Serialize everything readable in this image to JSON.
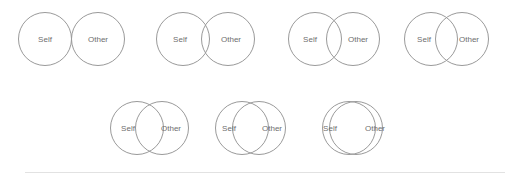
{
  "scale": {
    "name": "Inclusion of Other in the Self Scale",
    "label_self": "Self",
    "label_other": "Other",
    "stroke_color": "#9a9a9a",
    "label_color": "#6e6e6e",
    "background_color": "#ffffff",
    "divider_color": "#e2e2e2",
    "circle_radius": 26.5,
    "items": [
      {
        "index": 1,
        "overlap": 0,
        "left": 18,
        "top": 11,
        "self_x": 27,
        "other_x": 80,
        "cy": 28,
        "self_label_x": 27,
        "other_label_x": 80
      },
      {
        "index": 2,
        "overlap": 8,
        "left": 156,
        "top": 11,
        "self_x": 27,
        "other_x": 72,
        "cy": 28,
        "self_label_x": 24,
        "other_label_x": 75
      },
      {
        "index": 3,
        "overlap": 15,
        "left": 288,
        "top": 11,
        "self_x": 27,
        "other_x": 65,
        "cy": 28,
        "self_label_x": 22,
        "other_label_x": 70
      },
      {
        "index": 4,
        "overlap": 22,
        "left": 404,
        "top": 11,
        "self_x": 27,
        "other_x": 58,
        "cy": 28,
        "self_label_x": 20,
        "other_label_x": 65
      },
      {
        "index": 5,
        "overlap": 28,
        "left": 110,
        "top": 100,
        "self_x": 27,
        "other_x": 52,
        "cy": 28,
        "self_label_x": 18,
        "other_label_x": 61
      },
      {
        "index": 6,
        "overlap": 36,
        "left": 215,
        "top": 100,
        "self_x": 27,
        "other_x": 44,
        "cy": 28,
        "self_label_x": 14,
        "other_label_x": 57
      },
      {
        "index": 7,
        "overlap": 46,
        "left": 322,
        "top": 100,
        "self_x": 27,
        "other_x": 34,
        "cy": 28,
        "self_label_x": 8,
        "other_label_x": 53
      }
    ]
  },
  "divider": {
    "left": 25,
    "top": 172,
    "width": 480
  }
}
